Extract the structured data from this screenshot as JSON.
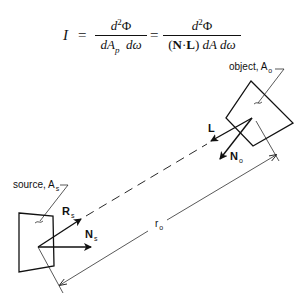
{
  "equation": {
    "lhs": "I",
    "equals": "=",
    "frac1": {
      "numerator": "d²Φ",
      "denominator": "dA_p dω"
    },
    "frac2": {
      "numerator": "d²Φ",
      "denominator": "(N·L) dA dω"
    }
  },
  "diagram": {
    "object_label": "object, A",
    "object_label_sub": "o",
    "source_label": "source, A",
    "source_label_sub": "s",
    "vectors": {
      "L": "L",
      "N_o": "N",
      "N_o_sub": "o",
      "R_s": "R",
      "R_s_sub": "s",
      "N_s": "N",
      "N_s_sub": "s"
    },
    "distance_label": "r",
    "distance_label_sub": "o"
  }
}
